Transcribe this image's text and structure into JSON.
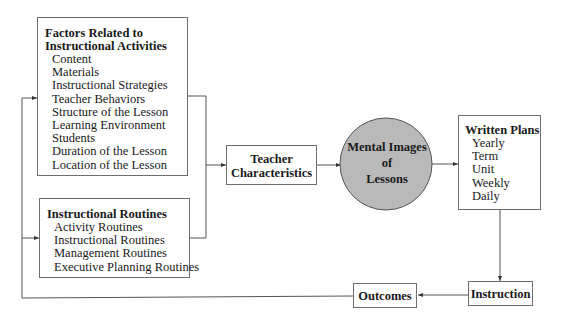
{
  "factors_box": {
    "title_line1": "Factors Related to",
    "title_line2": "Instructional Activities",
    "items": [
      "Content",
      "Materials",
      "Instructional Strategies",
      "Teacher Behaviors",
      "Structure of the Lesson",
      "Learning Environment",
      "Students",
      "Duration of the Lesson",
      "Location of the Lesson"
    ]
  },
  "routines_box": {
    "title": "Instructional Routines",
    "items": [
      "Activity Routines",
      "Instructional Routines",
      "Management Routines",
      "Executive Planning Routines"
    ]
  },
  "teacher_box": {
    "line1": "Teacher",
    "line2": "Characteristics"
  },
  "mental_images": {
    "line1": "Mental Images",
    "line2": "of",
    "line3": "Lessons",
    "fill": "#b9b9b9"
  },
  "written_plans": {
    "title": "Written Plans",
    "items": [
      "Yearly",
      "Term",
      "Unit",
      "Weekly",
      "Daily"
    ]
  },
  "instruction_box": {
    "label": "Instruction"
  },
  "outcomes_box": {
    "label": "Outcomes"
  }
}
